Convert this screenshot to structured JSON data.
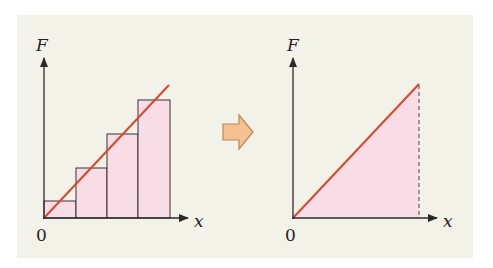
{
  "diagram": {
    "left_plot": {
      "y_label": "F",
      "x_label": "x",
      "origin_label": "0",
      "bars": [
        {
          "x0": 44,
          "x1": 76,
          "top": 201
        },
        {
          "x0": 76,
          "x1": 107,
          "top": 168
        },
        {
          "x0": 107,
          "x1": 138,
          "top": 134
        },
        {
          "x0": 138,
          "x1": 170,
          "top": 100
        }
      ],
      "line": {
        "x1": 44,
        "y1": 218,
        "x2": 169,
        "y2": 85
      }
    },
    "arrow": {
      "direction": "right",
      "meaning": "limit-transition"
    },
    "right_plot": {
      "y_label": "F",
      "x_label": "x",
      "origin_label": "0",
      "line": {
        "x1": 293,
        "y1": 218,
        "x2": 419,
        "y2": 84
      },
      "dashed_drop_x": 419
    },
    "colors": {
      "background": "#f3f2e9",
      "fill": "#f8dde6",
      "line": "#d9472b",
      "axis": "#2a2a2a",
      "arrow_fill": "#f4c18f",
      "arrow_stroke": "#b9875c"
    }
  }
}
